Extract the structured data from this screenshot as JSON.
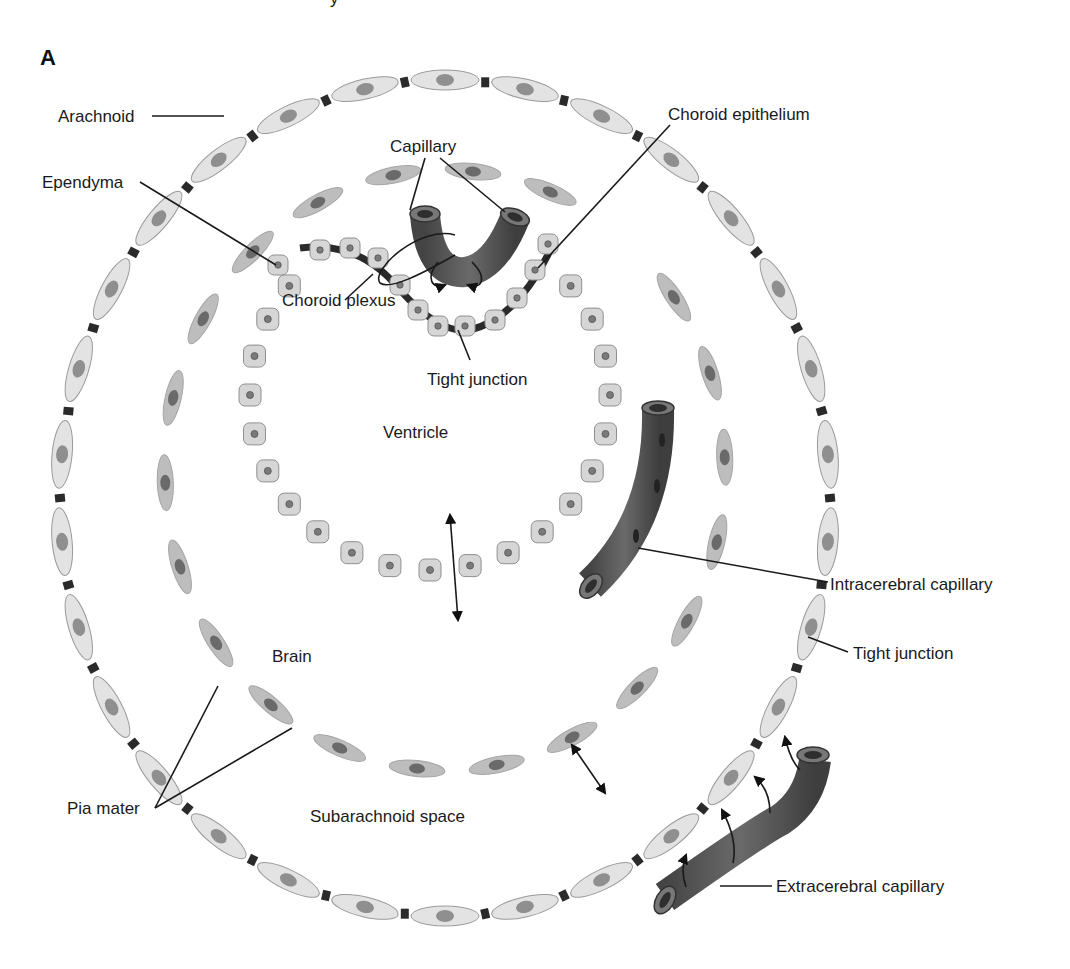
{
  "figure": {
    "panel_label": "A",
    "top_fragment": "y"
  },
  "regions": {
    "ventricle": "Ventricle",
    "brain": "Brain",
    "subarachnoid": "Subarachnoid space"
  },
  "labels": {
    "arachnoid": "Arachnoid",
    "ependyma": "Ependyma",
    "capillary": "Capillary",
    "choroid_epithelium": "Choroid epithelium",
    "choroid_plexus": "Choroid plexus",
    "tight_junction_inner": "Tight junction",
    "intracerebral_capillary": "Intracerebral capillary",
    "tight_junction_outer": "Tight junction",
    "pia_mater": "Pia mater",
    "extracerebral_capillary": "Extracerebral capillary"
  },
  "colors": {
    "arachnoid_cell": "#e3e3e3",
    "arachnoid_nucleus": "#8f8f8f",
    "pia_cell": "#bdbdbd",
    "pia_nucleus": "#6a6a6a",
    "ependyma_cell": "#d6d6d6",
    "capillary": "#5c5c5c",
    "junction": "#2a2a2a",
    "text": "#1a1a1a"
  }
}
